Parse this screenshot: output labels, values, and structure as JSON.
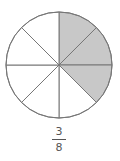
{
  "diagram": {
    "type": "fraction-circle",
    "total_parts": 8,
    "shaded_parts": 3,
    "shaded_color": "#c8c8c8",
    "unshaded_color": "#ffffff",
    "line_color": "#777777"
  },
  "fraction": {
    "numerator": "3",
    "denominator": "8"
  }
}
